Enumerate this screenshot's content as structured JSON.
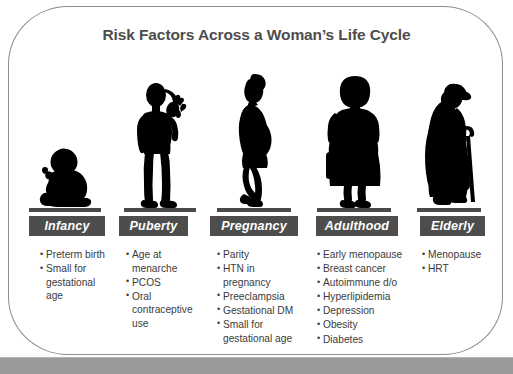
{
  "slide": {
    "title": "Risk Factors Across a Woman’s Life Cycle",
    "colors": {
      "frame_border": "#8d8d8d",
      "title_text": "#4d4d4d",
      "label_chip_bg": "#4d4d4d",
      "label_chip_text": "#ffffff",
      "body_text": "#3b3b3b",
      "silhouette": "#000000",
      "ground_bar": "#4a4a4a",
      "footer_bar": "#9a9a9a"
    }
  },
  "columns": [
    {
      "id": "infancy",
      "label": "Infancy",
      "figure_icon": "baby-sitting-silhouette",
      "risks": [
        "Preterm  birth",
        "Small for gestational age"
      ]
    },
    {
      "id": "puberty",
      "label": "Puberty",
      "figure_icon": "girl-waving-silhouette",
      "risks": [
        "Age at menarche",
        "PCOS",
        "Oral contraceptive use"
      ]
    },
    {
      "id": "pregnancy",
      "label": "Pregnancy",
      "figure_icon": "pregnant-woman-silhouette",
      "risks": [
        "Parity",
        "HTN in pregnancy",
        "Preeclampsia",
        "Gestational DM",
        "Small for gestational age"
      ]
    },
    {
      "id": "adulthood",
      "label": "Adulthood",
      "figure_icon": "adult-woman-handbag-silhouette",
      "risks": [
        "Early menopause",
        "Breast cancer",
        "Autoimmune  d/o",
        "Hyperlipidemia",
        "Depression",
        "Obesity",
        "Diabetes"
      ]
    },
    {
      "id": "elderly",
      "label": "Elderly",
      "figure_icon": "elderly-woman-cane-silhouette",
      "risks": [
        "Menopause",
        "HRT"
      ]
    }
  ]
}
